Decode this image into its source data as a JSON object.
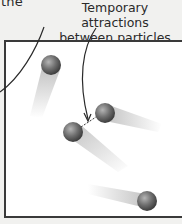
{
  "diagram": {
    "partial_text": "the",
    "label_line1": "Temporary attractions",
    "label_line2": "between particles",
    "colors": {
      "particle": "#6f6f6f",
      "particle_highlight": "#b5b5b5",
      "trail": "#bdbdbd",
      "box_border": "#3a3a3a",
      "leader_line": "#2a2a2a",
      "background": "#f1f1ef"
    },
    "particles": [
      {
        "id": 1,
        "cx": 51,
        "cy": 65,
        "r": 10
      },
      {
        "id": 2,
        "cx": 105,
        "cy": 113,
        "r": 10
      },
      {
        "id": 3,
        "cx": 73,
        "cy": 132,
        "r": 10
      },
      {
        "id": 4,
        "cx": 147,
        "cy": 201,
        "r": 10
      }
    ],
    "attraction_pairs": [
      {
        "from": 2,
        "to": 3
      }
    ]
  }
}
